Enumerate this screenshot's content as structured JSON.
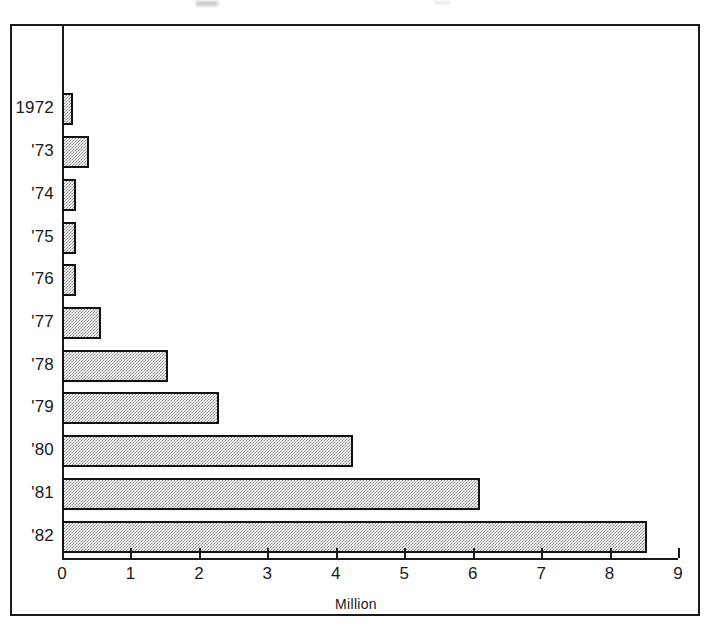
{
  "figure": {
    "background_color": "#ffffff",
    "line_color": "#1a1a1a",
    "bar_fill_color": "#8d8d8d",
    "bar_border_color": "#111111"
  },
  "chart_data": {
    "type": "bar",
    "orientation": "horizontal",
    "title": "",
    "xlabel": "Million",
    "ylabel": "",
    "categories": [
      "1972",
      "'73",
      "'74",
      "'75",
      "'76",
      "'77",
      "'78",
      "'79",
      "'80",
      "'81",
      "'82"
    ],
    "values": [
      0.16,
      0.4,
      0.2,
      0.21,
      0.2,
      0.57,
      1.55,
      2.3,
      4.25,
      6.1,
      8.55
    ],
    "xlim": [
      0,
      9
    ],
    "xticks": [
      0,
      1,
      2,
      3,
      4,
      5,
      6,
      7,
      8,
      9
    ],
    "xtick_labels": [
      "0",
      "1",
      "2",
      "3",
      "4",
      "5",
      "6",
      "7",
      "8",
      "9"
    ],
    "grid": false,
    "legend": null,
    "units": "Million"
  }
}
